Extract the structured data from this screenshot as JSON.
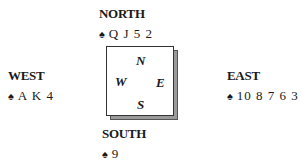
{
  "hands": {
    "north": {
      "label": "NORTH",
      "suit_icon": "spade-icon",
      "suit_glyph": "♠",
      "cards": "Q J 5 2"
    },
    "west": {
      "label": "WEST",
      "suit_icon": "spade-icon",
      "suit_glyph": "♠",
      "cards": "A K 4"
    },
    "east": {
      "label": "EAST",
      "suit_icon": "spade-icon",
      "suit_glyph": "♠",
      "cards": "10 8 7 6 3"
    },
    "south": {
      "label": "SOUTH",
      "suit_icon": "spade-icon",
      "suit_glyph": "♠",
      "cards": "9"
    }
  },
  "compass": {
    "n": "N",
    "w": "W",
    "e": "E",
    "s": "S"
  }
}
